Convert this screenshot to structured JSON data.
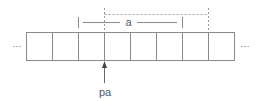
{
  "diagram": {
    "label_a": "a",
    "label_pa": "pa",
    "ellipsis_left": "···",
    "ellipsis_right": "···",
    "cell_count": 8,
    "colors": {
      "stroke": "#8a8a8a",
      "dashed": "#9a9a9a",
      "text": "#555555"
    }
  }
}
